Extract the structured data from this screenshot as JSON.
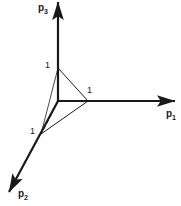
{
  "figure": {
    "type": "3d-axes-simplex-diagram",
    "width": 181,
    "height": 206,
    "background_color": "#ffffff",
    "stroke_color": "#1a1a1a",
    "origin": {
      "x": 58,
      "y": 101
    }
  },
  "axes": [
    {
      "name": "p1",
      "label_text": "p",
      "subscript": "1",
      "label_x": 166,
      "label_y": 109,
      "from": {
        "x": 58,
        "y": 101
      },
      "to": {
        "x": 175,
        "y": 101
      },
      "arrow": true,
      "stroke_width": 2.2
    },
    {
      "name": "p2",
      "label_text": "p",
      "subscript": "2",
      "label_x": 18,
      "label_y": 189,
      "from": {
        "x": 58,
        "y": 101
      },
      "to": {
        "x": 9,
        "y": 192
      },
      "arrow": true,
      "stroke_width": 2.2
    },
    {
      "name": "p3",
      "label_text": "p",
      "subscript": "3",
      "label_x": 38,
      "label_y": 3,
      "from": {
        "x": 58,
        "y": 101
      },
      "to": {
        "x": 58,
        "y": 2
      },
      "arrow": true,
      "stroke_width": 2.2
    }
  ],
  "vertices": [
    {
      "name": "vertex-p3",
      "x": 58,
      "y": 68,
      "tick_label": "1",
      "tick_x": 45,
      "tick_y": 61
    },
    {
      "name": "vertex-p1",
      "x": 88,
      "y": 101,
      "tick_label": "1",
      "tick_x": 87,
      "tick_y": 86
    },
    {
      "name": "vertex-p2",
      "x": 41,
      "y": 134,
      "tick_label": "1",
      "tick_x": 30,
      "tick_y": 127
    }
  ],
  "simplex_edges": [
    {
      "name": "edge-p3-p1",
      "from": {
        "x": 58,
        "y": 68
      },
      "to": {
        "x": 88,
        "y": 101
      },
      "style": "solid",
      "stroke_width": 1.0
    },
    {
      "name": "edge-p1-p2",
      "from": {
        "x": 88,
        "y": 101
      },
      "to": {
        "x": 41,
        "y": 134
      },
      "style": "solid",
      "stroke_width": 1.0
    },
    {
      "name": "edge-p2-p3",
      "from": {
        "x": 41,
        "y": 134
      },
      "to": {
        "x": 58,
        "y": 68
      },
      "style": "solid",
      "stroke_width": 0.8
    }
  ],
  "hidden_edges": [
    {
      "name": "hidden-origin-p3",
      "from": {
        "x": 58,
        "y": 101
      },
      "to": {
        "x": 58,
        "y": 68
      },
      "style": "dashed",
      "stroke_width": 1.3,
      "dash": "4,3"
    },
    {
      "name": "hidden-origin-p1",
      "from": {
        "x": 58,
        "y": 101
      },
      "to": {
        "x": 88,
        "y": 101
      },
      "style": "dashed",
      "stroke_width": 1.3,
      "dash": "4,3"
    },
    {
      "name": "hidden-origin-p2",
      "from": {
        "x": 58,
        "y": 101
      },
      "to": {
        "x": 41,
        "y": 134
      },
      "style": "dashed",
      "stroke_width": 1.3,
      "dash": "4,3"
    }
  ],
  "chart_data": {
    "type": "diagram",
    "title": "",
    "axis_names": [
      "p1",
      "p2",
      "p3"
    ],
    "axis_tick_values": [
      1,
      1,
      1
    ],
    "simplex_vertices": [
      {
        "coords": [
          1,
          0,
          0
        ],
        "label": "1",
        "axis": "p1"
      },
      {
        "coords": [
          0,
          1,
          0
        ],
        "label": "1",
        "axis": "p2"
      },
      {
        "coords": [
          0,
          0,
          1
        ],
        "label": "1",
        "axis": "p3"
      }
    ]
  }
}
